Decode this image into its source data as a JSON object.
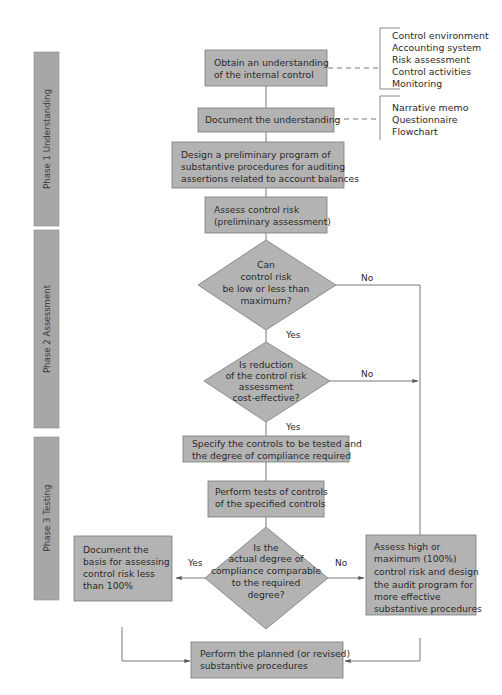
{
  "phases": [
    {
      "label": "Phase 1 Understanding"
    },
    {
      "label": "Phase 2 Assessment"
    },
    {
      "label": "Phase 3 Testing"
    }
  ],
  "nodes": {
    "obtain": {
      "lines": [
        "Obtain an understanding",
        "of the internal control"
      ]
    },
    "document": {
      "lines": [
        "Document the understanding"
      ]
    },
    "design": {
      "lines": [
        "Design a preliminary program of",
        "substantive procedures for auditing",
        "assertions related to account balances"
      ]
    },
    "assess_prelim": {
      "lines": [
        "Assess control risk",
        "(preliminary assessment)"
      ]
    },
    "decision_low": {
      "lines": [
        "Can",
        "control risk",
        "be low or less than",
        "maximum?"
      ]
    },
    "decision_cost": {
      "lines": [
        "Is reduction",
        "of the control risk",
        "assessment",
        "cost-effective?"
      ]
    },
    "specify": {
      "lines": [
        "Specify the controls to be tested and",
        "the degree of compliance required"
      ]
    },
    "perform_tests": {
      "lines": [
        "Perform tests of controls",
        "of the specified controls"
      ]
    },
    "decision_compliance": {
      "lines": [
        "Is the",
        "actual degree of",
        "compliance comparable",
        "to the required",
        "degree?"
      ]
    },
    "document_basis": {
      "lines": [
        "Document the",
        "basis for assessing",
        "control risk less",
        "than 100%"
      ]
    },
    "assess_high": {
      "lines": [
        "Assess high or",
        "maximum (100%)",
        "control risk and design",
        "the audit program for",
        "more effective",
        "substantive procedures"
      ]
    },
    "perform_substantive": {
      "lines": [
        "Perform the planned (or revised)",
        "substantive procedures"
      ]
    }
  },
  "side_lists": {
    "components": [
      "Control environment",
      "Accounting system",
      "Risk assessment",
      "Control activities",
      "Monitoring"
    ],
    "documentation": [
      "Narrative memo",
      "Questionnaire",
      "Flowchart"
    ]
  },
  "edge_labels": {
    "low_no": "No",
    "low_yes": "Yes",
    "cost_no": "No",
    "cost_yes": "Yes",
    "compliance_yes": "Yes",
    "compliance_no": "No"
  }
}
